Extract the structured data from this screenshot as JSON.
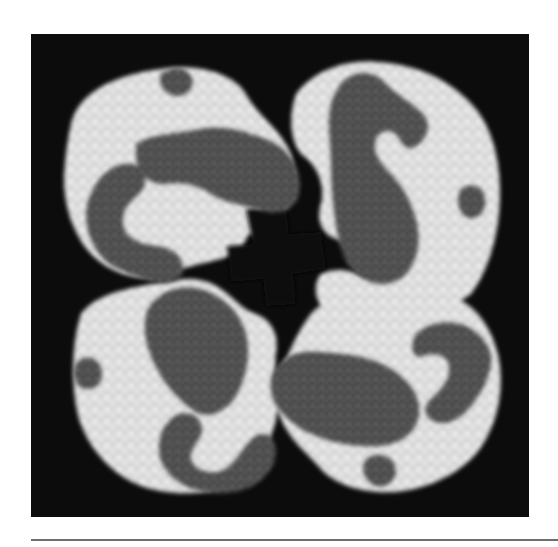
{
  "figure": {
    "colors": {
      "background": "#0c0c0c",
      "light_subunit": "#d8d8d8",
      "light_highlight": "#f4f4f4",
      "dark_subunit": "#4a4a4a",
      "dark_highlight": "#8a8a8a",
      "rule": "#6e6e6e"
    }
  }
}
